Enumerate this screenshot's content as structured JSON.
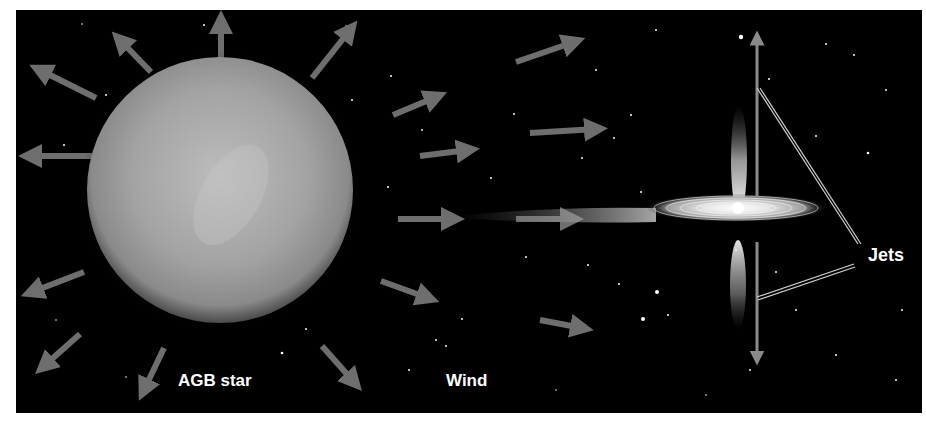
{
  "diagram": {
    "labels": {
      "agb_star": "AGB star",
      "wind": "Wind",
      "jets": "Jets"
    },
    "colors": {
      "background": "#000000",
      "star": "#9a9a9a",
      "arrows": "#6e6e6e",
      "jet_axis": "#8a8a8a",
      "text": "#ffffff"
    },
    "elements": [
      "AGB star",
      "outflowing wind arrows",
      "wind stream",
      "accretion disk",
      "bipolar jets",
      "jet axis arrows",
      "callout lines to Jets label"
    ]
  }
}
